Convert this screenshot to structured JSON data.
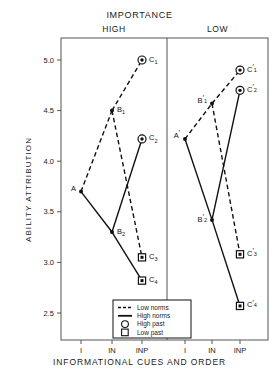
{
  "chart_data": {
    "type": "line",
    "title": "IMPORTANCE",
    "xlabel": "INFORMATIONAL CUES AND ORDER",
    "ylabel": "ABILITY ATTRIBUTION",
    "ylim": [
      2.5,
      5.0
    ],
    "yticks": [
      "5.0",
      "4.5",
      "4.0",
      "3.5",
      "3.0",
      "2.5"
    ],
    "ytick_values": [
      5.0,
      4.5,
      4.0,
      3.5,
      3.0,
      2.5
    ],
    "xticks": [
      "I",
      "IN",
      "INP"
    ],
    "grid": false,
    "legend_position": "bottom-center",
    "panels": [
      {
        "name": "HIGH",
        "label": "HIGH",
        "points": [
          {
            "id": "A",
            "label": "A",
            "sub": "",
            "x": "I",
            "y": 3.7,
            "marker": "dot"
          },
          {
            "id": "B1",
            "label": "B",
            "sub": "1",
            "x": "IN",
            "y": 4.5,
            "marker": "dot"
          },
          {
            "id": "B2",
            "label": "B",
            "sub": "2",
            "x": "IN",
            "y": 3.3,
            "marker": "dot"
          },
          {
            "id": "C1",
            "label": "C",
            "sub": "1",
            "x": "INP",
            "y": 5.0,
            "marker": "circle"
          },
          {
            "id": "C2",
            "label": "C",
            "sub": "2",
            "x": "INP",
            "y": 4.22,
            "marker": "circle"
          },
          {
            "id": "C3",
            "label": "C",
            "sub": "3",
            "x": "INP",
            "y": 3.05,
            "marker": "square"
          },
          {
            "id": "C4",
            "label": "C",
            "sub": "4",
            "x": "INP",
            "y": 2.82,
            "marker": "square"
          }
        ],
        "segments": [
          {
            "from": "A",
            "to": "B1",
            "style": "dashed"
          },
          {
            "from": "A",
            "to": "B2",
            "style": "solid"
          },
          {
            "from": "B1",
            "to": "C1",
            "style": "dashed"
          },
          {
            "from": "B1",
            "to": "C3",
            "style": "dashed"
          },
          {
            "from": "B2",
            "to": "C2",
            "style": "solid"
          },
          {
            "from": "B2",
            "to": "C4",
            "style": "solid"
          }
        ]
      },
      {
        "name": "LOW",
        "label": "LOW",
        "points": [
          {
            "id": "A",
            "label": "A",
            "sub": "",
            "x": "I",
            "y": 4.22,
            "marker": "dot",
            "prime": true
          },
          {
            "id": "B1",
            "label": "B",
            "sub": "1",
            "x": "IN",
            "y": 4.57,
            "marker": "dot",
            "prime": true
          },
          {
            "id": "B2",
            "label": "B",
            "sub": "2",
            "x": "IN",
            "y": 3.42,
            "marker": "dot",
            "prime": true
          },
          {
            "id": "C1",
            "label": "C",
            "sub": "1",
            "x": "INP",
            "y": 4.9,
            "marker": "circle",
            "prime": true
          },
          {
            "id": "C2",
            "label": "C",
            "sub": "2",
            "x": "INP",
            "y": 4.7,
            "marker": "circle",
            "prime": true
          },
          {
            "id": "C3",
            "label": "C",
            "sub": "3",
            "x": "INP",
            "y": 3.08,
            "marker": "square",
            "prime": true
          },
          {
            "id": "C4",
            "label": "C",
            "sub": "4",
            "x": "INP",
            "y": 2.57,
            "marker": "square",
            "prime": true
          }
        ],
        "segments": [
          {
            "from": "A",
            "to": "B1",
            "style": "dashed"
          },
          {
            "from": "A",
            "to": "B2",
            "style": "solid"
          },
          {
            "from": "B1",
            "to": "C1",
            "style": "dashed"
          },
          {
            "from": "B1",
            "to": "C3",
            "style": "dashed"
          },
          {
            "from": "B2",
            "to": "C2",
            "style": "solid"
          },
          {
            "from": "B2",
            "to": "C4",
            "style": "solid"
          }
        ]
      }
    ],
    "legend": [
      {
        "label": "Low norms",
        "symbol": "dashed-line"
      },
      {
        "label": "High norms",
        "symbol": "solid-line"
      },
      {
        "label": "High past",
        "symbol": "circle"
      },
      {
        "label": "Low past",
        "symbol": "square"
      }
    ],
    "colors": {
      "ink": "#111111",
      "axis": "#555555",
      "background": "#ffffff"
    }
  },
  "figure": {
    "super_title": "IMPORTANCE",
    "y_axis_title": "ABILITY ATTRIBUTION",
    "x_axis_title": "INFORMATIONAL CUES AND ORDER",
    "panel_high_title": "HIGH",
    "panel_low_title": "LOW"
  }
}
